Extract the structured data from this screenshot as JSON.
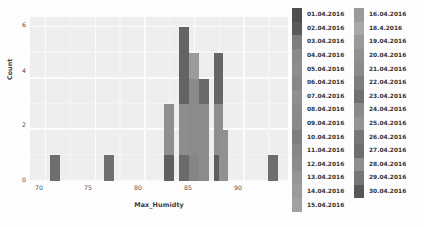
{
  "chart_data": {
    "type": "bar",
    "title": "",
    "xlabel": "Max_Humidty",
    "ylabel": "Count",
    "xlim": [
      68.5,
      94.5
    ],
    "ylim": [
      0,
      6.4
    ],
    "xticks": [
      "70",
      "75",
      "80",
      "85",
      "90"
    ],
    "xtick_values": [
      70,
      75,
      80,
      85,
      90
    ],
    "yticks": [
      "0",
      "2",
      "4",
      "6"
    ],
    "ytick_values": [
      0,
      2,
      4,
      6
    ],
    "grid": true,
    "legend_position": "right",
    "stacked": true,
    "bin_width": 1,
    "categories": [
      71,
      76.5,
      82.5,
      84,
      85,
      86,
      87.5,
      88,
      93
    ],
    "values": [
      1,
      1,
      3,
      6,
      5,
      4,
      5,
      2,
      1
    ],
    "bars": [
      {
        "x": 71,
        "total": 1,
        "segments": [
          {
            "value": 1,
            "color": "#6e6e6e"
          }
        ]
      },
      {
        "x": 76.5,
        "total": 1,
        "segments": [
          {
            "value": 1,
            "color": "#6f6f6f"
          }
        ]
      },
      {
        "x": 82.5,
        "total": 3,
        "segments": [
          {
            "value": 1,
            "color": "#5f5f5f"
          },
          {
            "value": 2,
            "color": "#8f8f8f"
          }
        ]
      },
      {
        "x": 84,
        "total": 6,
        "segments": [
          {
            "value": 1,
            "color": "#6a6a6a"
          },
          {
            "value": 2,
            "color": "#8d8d8d"
          },
          {
            "value": 3,
            "color": "#636363"
          }
        ]
      },
      {
        "x": 85,
        "total": 5,
        "segments": [
          {
            "value": 1,
            "color": "#858585"
          },
          {
            "value": 3,
            "color": "#8b8b8b"
          },
          {
            "value": 1,
            "color": "#9b9b9b"
          }
        ]
      },
      {
        "x": 86,
        "total": 4,
        "segments": [
          {
            "value": 3,
            "color": "#8c8c8c"
          },
          {
            "value": 1,
            "color": "#6a6a6a"
          }
        ]
      },
      {
        "x": 87.5,
        "total": 5,
        "segments": [
          {
            "value": 1,
            "color": "#5e5e5e"
          },
          {
            "value": 2,
            "color": "#8e8e8e"
          },
          {
            "value": 2,
            "color": "#666666"
          }
        ]
      },
      {
        "x": 88,
        "total": 2,
        "segments": [
          {
            "value": 2,
            "color": "#909090"
          }
        ]
      },
      {
        "x": 93,
        "total": 1,
        "segments": [
          {
            "value": 1,
            "color": "#6d6d6d"
          }
        ]
      }
    ],
    "legend": {
      "column_1": [
        {
          "label": "01.04.2016",
          "color": "#4f4f4f"
        },
        {
          "label": "02.04.2016",
          "color": "#5a5a5a"
        },
        {
          "label": "03.04.2016",
          "color": "#7d7d7d"
        },
        {
          "label": "04.04.2016",
          "color": "#8a8a8a"
        },
        {
          "label": "05.04.2016",
          "color": "#8e8e8e"
        },
        {
          "label": "06.04.2016",
          "color": "#888888"
        },
        {
          "label": "07.04.2016",
          "color": "#909090"
        },
        {
          "label": "08.04.2016",
          "color": "#8b8b8b"
        },
        {
          "label": "09.04.2016",
          "color": "#898989"
        },
        {
          "label": "10.04.2016",
          "color": "#7e7e7e"
        },
        {
          "label": "11.04.2016",
          "color": "#878787"
        },
        {
          "label": "12.04.2016",
          "color": "#8c8c8c"
        },
        {
          "label": "13.04.2016",
          "color": "#969696"
        },
        {
          "label": "14.04.2016",
          "color": "#9b9b9b"
        },
        {
          "label": "15.04.2016",
          "color": "#a2a2a2"
        }
      ],
      "column_2": [
        {
          "label": "16.04.2016",
          "color": "#9a9a9a"
        },
        {
          "label": "18.4.2016",
          "color": "#a8a8a8"
        },
        {
          "label": "19.04.2016",
          "color": "#999999"
        },
        {
          "label": "20.04.2016",
          "color": "#909090"
        },
        {
          "label": "21.04.2016",
          "color": "#8b8b8b"
        },
        {
          "label": "22.04.2016",
          "color": "#7d7d7d"
        },
        {
          "label": "23.04.2016",
          "color": "#6f6f6f"
        },
        {
          "label": "24.04.2016",
          "color": "#8a8a8a"
        },
        {
          "label": "25.04.2016",
          "color": "#949494"
        },
        {
          "label": "26.04.2016",
          "color": "#777777"
        },
        {
          "label": "27.04.2016",
          "color": "#6d6d6d"
        },
        {
          "label": "28.04.2016",
          "color": "#8e8e8e"
        },
        {
          "label": "29.04.2016",
          "color": "#757575"
        },
        {
          "label": "30.04.2016",
          "color": "#575757"
        }
      ]
    }
  }
}
